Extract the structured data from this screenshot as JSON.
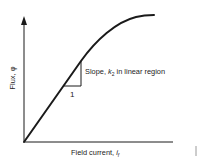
{
  "diagram": {
    "type": "magnetization_curve",
    "y_axis": {
      "label": "Flux, φ"
    },
    "x_axis": {
      "label_main": "Field current, ",
      "label_var": "i",
      "label_sub": "f"
    },
    "annotation": {
      "slope_label_prefix": "Slope, ",
      "slope_var": "k",
      "slope_sub": "2",
      "slope_label_suffix": " in linear region",
      "run_label": "1"
    },
    "colors": {
      "line": "#1a1a1a",
      "text": "#222222",
      "background": "#ffffff"
    }
  }
}
